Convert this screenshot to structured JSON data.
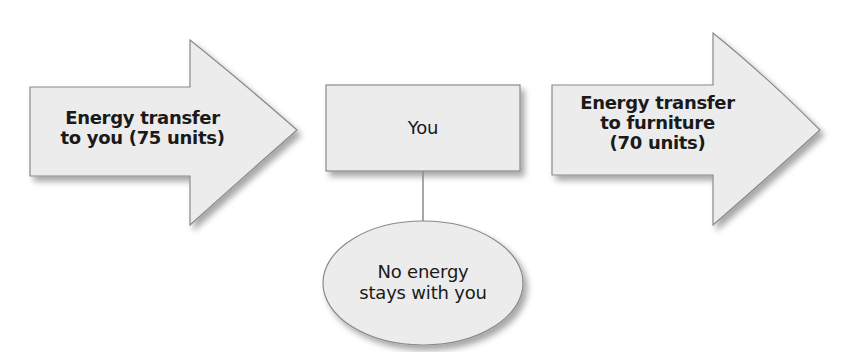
{
  "diagram": {
    "colors": {
      "fill": "#ececec",
      "stroke": "#8a8a8a",
      "text": "#1a1a1a",
      "background": "#ffffff"
    },
    "input_arrow": {
      "line1": "Energy transfer",
      "line2": "to you (75 units)"
    },
    "center_box": {
      "label": "You"
    },
    "retained_ellipse": {
      "line1": "No energy",
      "line2": "stays with you"
    },
    "output_arrow": {
      "line1": "Energy transfer",
      "line2": "to furniture",
      "line3": "(70 units)"
    }
  }
}
